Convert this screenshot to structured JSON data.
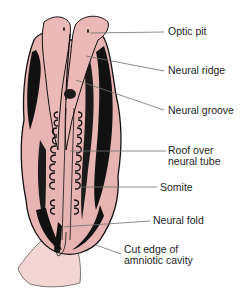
{
  "diagram": {
    "colors": {
      "tissue": "#e8b4b2",
      "tissue_light": "#f1cfcd",
      "outline": "#111111",
      "leader": "#6e6e6e",
      "text": "#1e1e1e"
    },
    "labels": [
      {
        "id": "optic-pit",
        "lines": [
          "Optic pit"
        ],
        "x": 168,
        "y": 26
      },
      {
        "id": "neural-ridge",
        "lines": [
          "Neural ridge"
        ],
        "x": 168,
        "y": 65
      },
      {
        "id": "neural-groove",
        "lines": [
          "Neural groove"
        ],
        "x": 168,
        "y": 105
      },
      {
        "id": "roof-over-neural-tube",
        "lines": [
          "Roof over",
          "neural tube"
        ],
        "x": 168,
        "y": 147
      },
      {
        "id": "somite",
        "lines": [
          "Somite"
        ],
        "x": 160,
        "y": 182
      },
      {
        "id": "neural-fold",
        "lines": [
          "Neural fold"
        ],
        "x": 153,
        "y": 216
      },
      {
        "id": "cut-edge-of-amniotic-cavity",
        "lines": [
          "Cut edge of",
          "amniotic cavity"
        ],
        "x": 124,
        "y": 245
      }
    ]
  }
}
